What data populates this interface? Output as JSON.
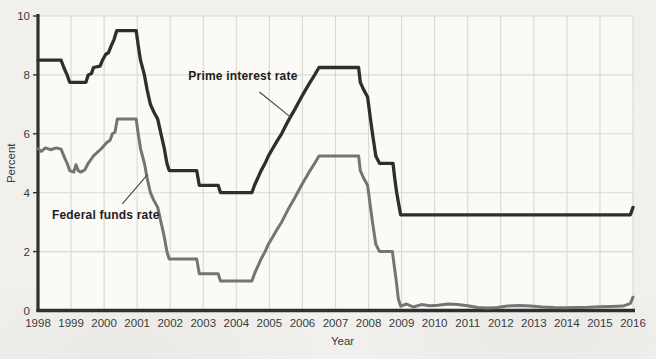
{
  "chart_data": {
    "type": "line",
    "xlabel": "Year",
    "ylabel": "Percent",
    "xlim": [
      1998,
      2016
    ],
    "ylim": [
      0,
      10
    ],
    "x_ticks": [
      1998,
      1999,
      2000,
      2001,
      2002,
      2003,
      2004,
      2005,
      2006,
      2007,
      2008,
      2009,
      2010,
      2011,
      2012,
      2013,
      2014,
      2015,
      2016
    ],
    "y_ticks": [
      0,
      2,
      4,
      6,
      8,
      10
    ],
    "grid": true,
    "legend_position": "inline-annotations",
    "series": [
      {
        "name": "Prime interest rate",
        "color": "#2e2e2e",
        "points": [
          [
            1998.0,
            8.5
          ],
          [
            1998.7,
            8.5
          ],
          [
            1998.78,
            8.25
          ],
          [
            1998.88,
            8.0
          ],
          [
            1998.96,
            7.75
          ],
          [
            1999.45,
            7.75
          ],
          [
            1999.52,
            8.0
          ],
          [
            1999.62,
            8.05
          ],
          [
            1999.68,
            8.25
          ],
          [
            1999.88,
            8.3
          ],
          [
            1999.95,
            8.5
          ],
          [
            2000.05,
            8.7
          ],
          [
            2000.13,
            8.75
          ],
          [
            2000.22,
            9.0
          ],
          [
            2000.3,
            9.2
          ],
          [
            2000.38,
            9.5
          ],
          [
            2000.97,
            9.5
          ],
          [
            2001.03,
            9.0
          ],
          [
            2001.1,
            8.5
          ],
          [
            2001.22,
            8.0
          ],
          [
            2001.3,
            7.5
          ],
          [
            2001.4,
            7.0
          ],
          [
            2001.5,
            6.75
          ],
          [
            2001.62,
            6.5
          ],
          [
            2001.72,
            6.0
          ],
          [
            2001.82,
            5.5
          ],
          [
            2001.9,
            5.0
          ],
          [
            2001.97,
            4.75
          ],
          [
            2002.8,
            4.75
          ],
          [
            2002.88,
            4.25
          ],
          [
            2003.45,
            4.25
          ],
          [
            2003.52,
            4.0
          ],
          [
            2004.47,
            4.0
          ],
          [
            2004.55,
            4.25
          ],
          [
            2004.65,
            4.5
          ],
          [
            2004.75,
            4.75
          ],
          [
            2004.87,
            5.0
          ],
          [
            2004.97,
            5.25
          ],
          [
            2005.1,
            5.5
          ],
          [
            2005.23,
            5.75
          ],
          [
            2005.37,
            6.0
          ],
          [
            2005.48,
            6.25
          ],
          [
            2005.6,
            6.5
          ],
          [
            2005.73,
            6.75
          ],
          [
            2005.85,
            7.0
          ],
          [
            2005.97,
            7.25
          ],
          [
            2006.1,
            7.5
          ],
          [
            2006.23,
            7.75
          ],
          [
            2006.37,
            8.0
          ],
          [
            2006.5,
            8.25
          ],
          [
            2007.7,
            8.25
          ],
          [
            2007.75,
            7.75
          ],
          [
            2007.85,
            7.5
          ],
          [
            2007.97,
            7.25
          ],
          [
            2008.06,
            6.5
          ],
          [
            2008.12,
            6.0
          ],
          [
            2008.22,
            5.25
          ],
          [
            2008.33,
            5.0
          ],
          [
            2008.74,
            5.0
          ],
          [
            2008.79,
            4.5
          ],
          [
            2008.85,
            4.0
          ],
          [
            2008.93,
            3.5
          ],
          [
            2008.97,
            3.25
          ],
          [
            2015.92,
            3.25
          ],
          [
            2016.0,
            3.5
          ]
        ]
      },
      {
        "name": "Federal funds rate",
        "color": "#747474",
        "points": [
          [
            1998.0,
            5.5
          ],
          [
            1998.1,
            5.4
          ],
          [
            1998.22,
            5.52
          ],
          [
            1998.38,
            5.46
          ],
          [
            1998.55,
            5.52
          ],
          [
            1998.7,
            5.48
          ],
          [
            1998.78,
            5.25
          ],
          [
            1998.88,
            5.0
          ],
          [
            1998.96,
            4.75
          ],
          [
            1999.08,
            4.7
          ],
          [
            1999.15,
            4.95
          ],
          [
            1999.22,
            4.75
          ],
          [
            1999.3,
            4.7
          ],
          [
            1999.42,
            4.78
          ],
          [
            1999.52,
            5.0
          ],
          [
            1999.68,
            5.25
          ],
          [
            1999.92,
            5.5
          ],
          [
            2000.08,
            5.7
          ],
          [
            2000.18,
            5.78
          ],
          [
            2000.25,
            6.0
          ],
          [
            2000.33,
            6.05
          ],
          [
            2000.4,
            6.5
          ],
          [
            2000.97,
            6.5
          ],
          [
            2001.03,
            6.0
          ],
          [
            2001.1,
            5.5
          ],
          [
            2001.22,
            5.0
          ],
          [
            2001.3,
            4.5
          ],
          [
            2001.4,
            4.0
          ],
          [
            2001.5,
            3.75
          ],
          [
            2001.62,
            3.5
          ],
          [
            2001.72,
            3.0
          ],
          [
            2001.82,
            2.5
          ],
          [
            2001.9,
            2.0
          ],
          [
            2001.97,
            1.75
          ],
          [
            2002.8,
            1.75
          ],
          [
            2002.88,
            1.25
          ],
          [
            2003.45,
            1.25
          ],
          [
            2003.52,
            1.0
          ],
          [
            2004.47,
            1.0
          ],
          [
            2004.55,
            1.25
          ],
          [
            2004.65,
            1.5
          ],
          [
            2004.75,
            1.75
          ],
          [
            2004.87,
            2.0
          ],
          [
            2004.97,
            2.25
          ],
          [
            2005.1,
            2.5
          ],
          [
            2005.23,
            2.75
          ],
          [
            2005.37,
            3.0
          ],
          [
            2005.48,
            3.25
          ],
          [
            2005.6,
            3.5
          ],
          [
            2005.73,
            3.75
          ],
          [
            2005.85,
            4.0
          ],
          [
            2005.97,
            4.25
          ],
          [
            2006.1,
            4.5
          ],
          [
            2006.23,
            4.75
          ],
          [
            2006.37,
            5.0
          ],
          [
            2006.5,
            5.25
          ],
          [
            2007.7,
            5.25
          ],
          [
            2007.75,
            4.75
          ],
          [
            2007.85,
            4.5
          ],
          [
            2007.97,
            4.25
          ],
          [
            2008.06,
            3.5
          ],
          [
            2008.12,
            3.0
          ],
          [
            2008.22,
            2.25
          ],
          [
            2008.33,
            2.0
          ],
          [
            2008.72,
            2.0
          ],
          [
            2008.78,
            1.5
          ],
          [
            2008.84,
            1.0
          ],
          [
            2008.9,
            0.4
          ],
          [
            2008.97,
            0.15
          ],
          [
            2009.15,
            0.22
          ],
          [
            2009.35,
            0.12
          ],
          [
            2009.6,
            0.2
          ],
          [
            2009.85,
            0.16
          ],
          [
            2010.1,
            0.18
          ],
          [
            2010.4,
            0.22
          ],
          [
            2010.7,
            0.2
          ],
          [
            2011.0,
            0.16
          ],
          [
            2011.3,
            0.1
          ],
          [
            2011.6,
            0.08
          ],
          [
            2011.9,
            0.1
          ],
          [
            2012.2,
            0.15
          ],
          [
            2012.55,
            0.17
          ],
          [
            2012.9,
            0.15
          ],
          [
            2013.25,
            0.12
          ],
          [
            2013.6,
            0.1
          ],
          [
            2013.95,
            0.09
          ],
          [
            2014.3,
            0.1
          ],
          [
            2014.65,
            0.11
          ],
          [
            2015.0,
            0.13
          ],
          [
            2015.35,
            0.14
          ],
          [
            2015.7,
            0.15
          ],
          [
            2015.92,
            0.24
          ],
          [
            2016.0,
            0.45
          ]
        ]
      }
    ],
    "annotations": [
      {
        "text": "Prime interest rate",
        "text_x": 2004.2,
        "text_y": 7.95,
        "leader_from": [
          2004.7,
          7.42
        ],
        "leader_to": [
          2005.66,
          6.55
        ]
      },
      {
        "text": "Federal funds rate",
        "text_x": 2000.05,
        "text_y": 3.25,
        "leader_from": [
          2000.55,
          3.62
        ],
        "leader_to": [
          2001.32,
          4.62
        ]
      }
    ]
  },
  "colors": {
    "grid": "#d9d8d4",
    "axis": "#2f2f2f",
    "tick_text": "#3a3a3a",
    "axis_title_text": "#3a3a3a",
    "annotation_text": "#1d1d1d",
    "leader_line": "#4a4a4a",
    "plot_background": "#fbfaf7"
  }
}
